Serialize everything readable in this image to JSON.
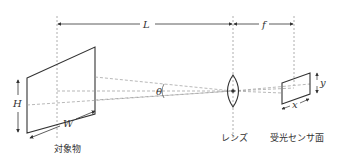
{
  "diagram": {
    "labels": {
      "distance_L": "L",
      "focal_f": "f",
      "object_height": "H",
      "object_width": "W",
      "angle": "θ",
      "sensor_height": "y",
      "sensor_width": "x"
    },
    "captions": {
      "object": "対象物",
      "lens": "レンズ",
      "sensor": "受光センサ面"
    },
    "colors": {
      "line": "#333333",
      "dashed": "#999999"
    }
  }
}
